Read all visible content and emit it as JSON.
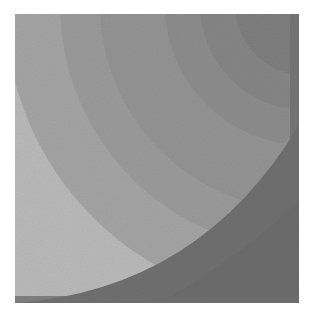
{
  "image": {
    "description": "Abstract grayscale print of overlapping concentric quarter-circle arcs",
    "square": {
      "x": 15,
      "y": 14,
      "width": 284,
      "height": 289
    },
    "colors": {
      "background": "#ffffff",
      "band_lightest": "#b9b9b9",
      "band_light": "#a3a3a3",
      "band_mid": "#939393",
      "band_dark": "#858585",
      "band_darker": "#7a7a7a",
      "band_darkest": "#6c6c6c",
      "lower_shadow": "#6e6e6e"
    }
  }
}
